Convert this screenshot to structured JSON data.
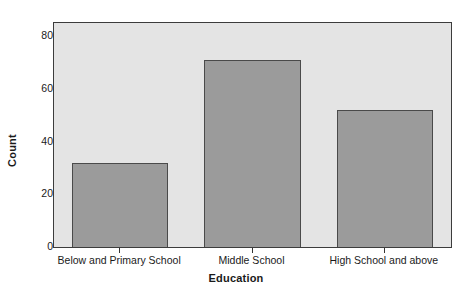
{
  "chart_data": {
    "type": "bar",
    "title": "",
    "subtitle": "",
    "xlabel": "Education",
    "ylabel": "Count",
    "categories": [
      "Below and Primary School",
      "Middle School",
      "High School and above"
    ],
    "values": [
      32,
      71,
      52
    ],
    "series": [
      {
        "name": "Count",
        "values": [
          32,
          71,
          52
        ]
      }
    ],
    "ylim": [
      0,
      85
    ],
    "yticks": [
      0,
      20,
      40,
      60,
      80
    ],
    "ytick_labels": [
      "0",
      "20",
      "40",
      "60",
      "80"
    ],
    "grid": false,
    "legend": false,
    "legend_position": "none",
    "annotations": [],
    "colors": {
      "bar_fill": "#9b9b9b",
      "bar_edge": "#4a4a4a",
      "plot_background": "#e4e4e4",
      "figure_background": "#ffffff",
      "axis_line": "#3c3c3c",
      "text": "#1a1a1a"
    }
  }
}
